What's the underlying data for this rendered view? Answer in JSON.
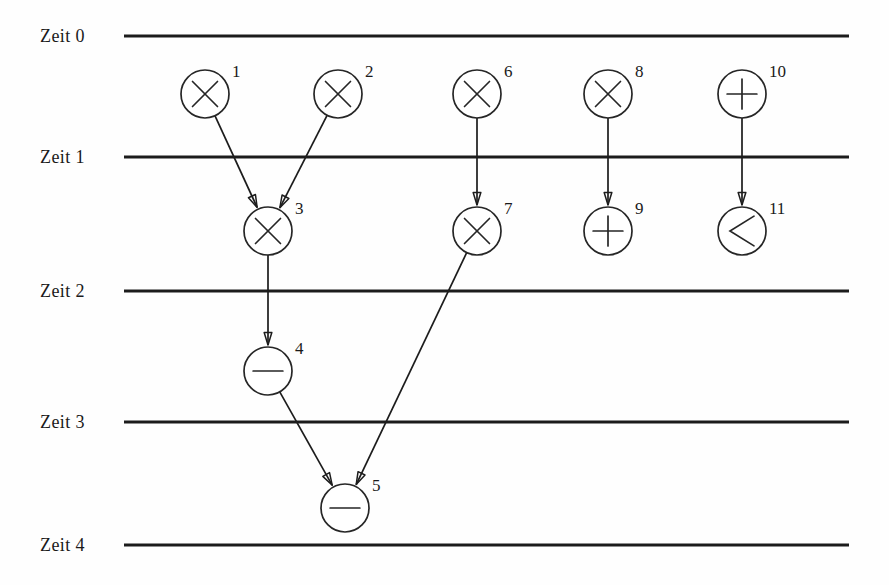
{
  "figure": {
    "kind": "scheduling-timeline-dag",
    "language": "de",
    "background_color": "#fefefe",
    "ink_color": "#1c1c1c",
    "width": 889,
    "height": 585
  },
  "time_axis": {
    "label_prefix": "Zeit",
    "line_x_start": 124,
    "line_x_end": 849,
    "label_x": 40,
    "steps": [
      {
        "id": "zeit-0",
        "label": "Zeit 0",
        "value": 0,
        "y": 36
      },
      {
        "id": "zeit-1",
        "label": "Zeit 1",
        "value": 1,
        "y": 157
      },
      {
        "id": "zeit-2",
        "label": "Zeit 2",
        "value": 2,
        "y": 291
      },
      {
        "id": "zeit-3",
        "label": "Zeit 3",
        "value": 3,
        "y": 422
      },
      {
        "id": "zeit-4",
        "label": "Zeit 4",
        "value": 4,
        "y": 545
      }
    ]
  },
  "operations": {
    "radius": 24,
    "index_label_dx": 27,
    "index_label_dy": -17,
    "nodes": [
      {
        "id": "op-1",
        "index": "1",
        "op": "multiply",
        "glyph": "times-icon",
        "cx": 205,
        "cy": 94,
        "slot": 0
      },
      {
        "id": "op-2",
        "index": "2",
        "op": "multiply",
        "glyph": "times-icon",
        "cx": 338,
        "cy": 94,
        "slot": 0
      },
      {
        "id": "op-6",
        "index": "6",
        "op": "multiply",
        "glyph": "times-icon",
        "cx": 477,
        "cy": 94,
        "slot": 0
      },
      {
        "id": "op-8",
        "index": "8",
        "op": "multiply",
        "glyph": "times-icon",
        "cx": 608,
        "cy": 94,
        "slot": 0
      },
      {
        "id": "op-10",
        "index": "10",
        "op": "add",
        "glyph": "plus-icon",
        "cx": 742,
        "cy": 94,
        "slot": 0
      },
      {
        "id": "op-3",
        "index": "3",
        "op": "multiply",
        "glyph": "times-icon",
        "cx": 268,
        "cy": 231,
        "slot": 1
      },
      {
        "id": "op-7",
        "index": "7",
        "op": "multiply",
        "glyph": "times-icon",
        "cx": 477,
        "cy": 231,
        "slot": 1
      },
      {
        "id": "op-9",
        "index": "9",
        "op": "add",
        "glyph": "plus-icon",
        "cx": 608,
        "cy": 231,
        "slot": 1
      },
      {
        "id": "op-11",
        "index": "11",
        "op": "less-than",
        "glyph": "less-than-icon",
        "cx": 742,
        "cy": 231,
        "slot": 1
      },
      {
        "id": "op-4",
        "index": "4",
        "op": "subtract",
        "glyph": "minus-icon",
        "cx": 268,
        "cy": 371,
        "slot": 2
      },
      {
        "id": "op-5",
        "index": "5",
        "op": "subtract",
        "glyph": "minus-icon",
        "cx": 345,
        "cy": 508,
        "slot": 3
      }
    ]
  },
  "edges": [
    {
      "id": "edge-1-3",
      "from": "op-1",
      "to": "op-3",
      "arrow": true
    },
    {
      "id": "edge-2-3",
      "from": "op-2",
      "to": "op-3",
      "arrow": true
    },
    {
      "id": "edge-6-7",
      "from": "op-6",
      "to": "op-7",
      "arrow": true
    },
    {
      "id": "edge-8-9",
      "from": "op-8",
      "to": "op-9",
      "arrow": true
    },
    {
      "id": "edge-10-11",
      "from": "op-10",
      "to": "op-11",
      "arrow": true
    },
    {
      "id": "edge-3-4",
      "from": "op-3",
      "to": "op-4",
      "arrow": true
    },
    {
      "id": "edge-4-5",
      "from": "op-4",
      "to": "op-5",
      "arrow": true
    },
    {
      "id": "edge-7-5",
      "from": "op-7",
      "to": "op-5",
      "arrow": true
    }
  ]
}
